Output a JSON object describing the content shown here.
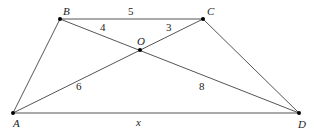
{
  "diagram": {
    "type": "trapezoid-with-diagonals",
    "points": {
      "A": {
        "label": "A",
        "x": 13,
        "y": 113
      },
      "B": {
        "label": "B",
        "x": 60,
        "y": 19
      },
      "C": {
        "label": "C",
        "x": 203,
        "y": 19
      },
      "D": {
        "label": "D",
        "x": 299,
        "y": 113
      },
      "O": {
        "label": "O",
        "x": 140,
        "y": 50
      }
    },
    "segments": {
      "BC": "5",
      "BO": "4",
      "OC": "3",
      "AO": "6",
      "OD": "8",
      "AD": "x"
    }
  }
}
